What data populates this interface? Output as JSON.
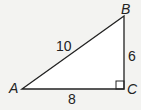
{
  "diagram": {
    "type": "right-triangle",
    "vertices": {
      "A": "A",
      "B": "B",
      "C": "C"
    },
    "sides": {
      "AB": "10",
      "BC": "6",
      "AC": "8"
    },
    "right_angle_at": "C",
    "colors": {
      "fill": "#ffffff",
      "stroke": "#222222",
      "background": "#f3f3f1"
    }
  }
}
